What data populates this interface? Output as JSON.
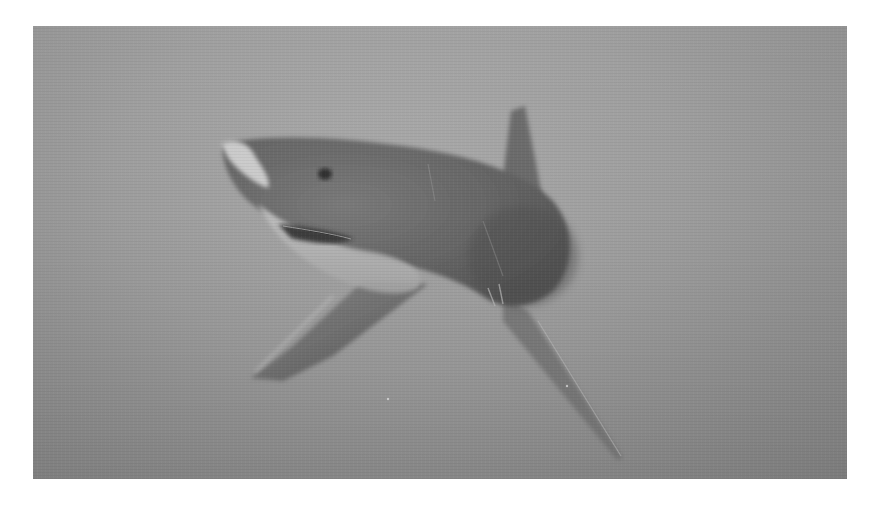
{
  "image": {
    "subject": "great white shark swimming underwater",
    "style": "grayscale photograph",
    "colors": {
      "water_light": "#a9a9a9",
      "water_mid": "#9d9d9d",
      "water_dark": "#868686",
      "shark_back": "#6e6e6e",
      "shark_dark": "#5a5a5a",
      "shark_belly": "#bdbdbd",
      "page_background": "#ffffff"
    }
  }
}
